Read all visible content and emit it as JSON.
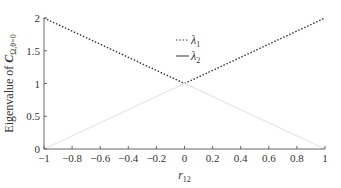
{
  "chart_data": {
    "type": "line",
    "title": "",
    "xlabel": "r",
    "xlabel_sub": "12",
    "ylabel": "Eigenvalue of ",
    "ylabel_bold": "C",
    "ylabel_sub": "Ω,θ=0",
    "xlim": [
      -1,
      1
    ],
    "ylim": [
      0,
      2
    ],
    "xticks": [
      -1,
      -0.8,
      -0.6,
      -0.4,
      -0.2,
      0,
      0.2,
      0.4,
      0.6,
      0.8,
      1
    ],
    "xtick_labels": [
      "−1",
      "−0.8",
      "−0.6",
      "−0.4",
      "−0.2",
      "0",
      "0.2",
      "0.4",
      "0.6",
      "0.8",
      "1"
    ],
    "yticks": [
      0,
      0.5,
      1,
      1.5,
      2
    ],
    "ytick_labels": [
      "0",
      "0.5",
      "1",
      "1.5",
      "2"
    ],
    "grid": false,
    "legend_position": "top-center",
    "series": [
      {
        "name": "λ1",
        "label_main": "λ",
        "label_sub": "1",
        "style": "dotted",
        "color": "#333333",
        "x": [
          -1,
          0,
          1
        ],
        "y": [
          2,
          1,
          2
        ]
      },
      {
        "name": "λ2",
        "label_main": "λ",
        "label_sub": "2",
        "style": "solid",
        "color": "#e6e6e6",
        "x": [
          -1,
          0,
          1
        ],
        "y": [
          0,
          1,
          0
        ]
      }
    ]
  }
}
